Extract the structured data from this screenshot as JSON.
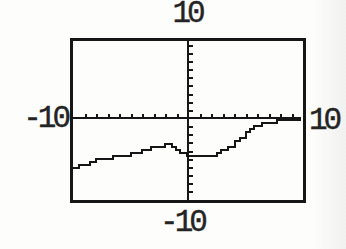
{
  "figure": {
    "window_labels": {
      "top": "10",
      "bottom": "-10",
      "left": "-10",
      "right": "10"
    }
  },
  "chart_data": {
    "type": "line",
    "title": "",
    "xlabel": "",
    "ylabel": "",
    "xlim": [
      -10,
      10
    ],
    "ylim": [
      -10,
      10
    ],
    "x_tick_spacing": 1,
    "y_tick_spacing": 1,
    "grid": false,
    "legend": false,
    "axis_edge_labels": {
      "xmin": "-10",
      "xmax": "10",
      "ymin": "-10",
      "ymax": "10"
    },
    "series": [
      {
        "name": "plotted-function",
        "points": [
          [
            -9.9,
            -6.0
          ],
          [
            -9.0,
            -5.6
          ],
          [
            -8.0,
            -5.2
          ],
          [
            -7.0,
            -4.9
          ],
          [
            -6.0,
            -4.7
          ],
          [
            -5.0,
            -4.35
          ],
          [
            -4.0,
            -4.05
          ],
          [
            -3.2,
            -3.7
          ],
          [
            -2.5,
            -3.45
          ],
          [
            -2.0,
            -3.35
          ],
          [
            -1.4,
            -3.7
          ],
          [
            -0.7,
            -4.2
          ],
          [
            -0.1,
            -4.6
          ],
          [
            0.6,
            -4.75
          ],
          [
            1.6,
            -4.8
          ],
          [
            2.2,
            -4.5
          ],
          [
            2.9,
            -4.0
          ],
          [
            3.5,
            -3.45
          ],
          [
            4.1,
            -2.9
          ],
          [
            5.0,
            -1.7
          ],
          [
            5.7,
            -1.1
          ],
          [
            6.4,
            -0.75
          ],
          [
            7.3,
            -0.5
          ],
          [
            8.2,
            -0.35
          ],
          [
            8.9,
            -0.25
          ],
          [
            9.7,
            -0.1
          ]
        ]
      }
    ],
    "features": {
      "local_max": [
        -2.0,
        -3.35
      ],
      "local_min": [
        1.1,
        -4.8
      ],
      "approaches_x_axis_near": 10
    },
    "colors": {
      "ink": "#161616",
      "paper": "#fdfdfc"
    }
  }
}
